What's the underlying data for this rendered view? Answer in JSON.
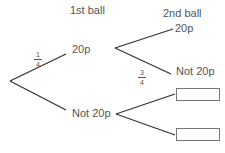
{
  "headers": {
    "first": "1st ball",
    "second": "2nd ball"
  },
  "first_branch": {
    "upper": {
      "label": "20p",
      "probability": {
        "numerator": "1",
        "denominator": "4"
      }
    },
    "lower": {
      "label": "Not 20p"
    }
  },
  "second_branch": {
    "from_20p": {
      "upper": {
        "label": "20p"
      },
      "lower": {
        "label": "Not 20p",
        "probability": {
          "numerator": "3",
          "denominator": "4"
        }
      }
    },
    "from_not_20p": {
      "upper": {
        "answer_box": ""
      },
      "lower": {
        "answer_box": ""
      }
    }
  }
}
